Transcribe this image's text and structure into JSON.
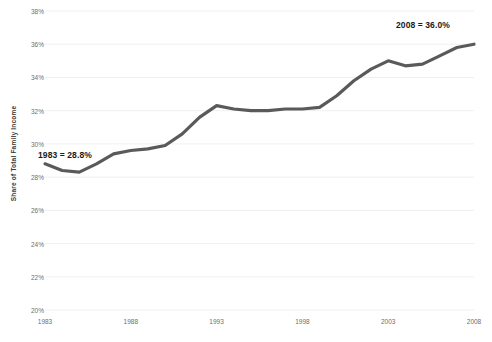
{
  "chart_data": {
    "type": "line",
    "title": "",
    "xlabel": "",
    "ylabel": "Share of Total Family Income",
    "xlim": [
      1983,
      2008
    ],
    "ylim": [
      20,
      38
    ],
    "ytick_labels": [
      "38%",
      "36%",
      "34%",
      "32%",
      "30%",
      "28%",
      "26%",
      "24%",
      "22%",
      "20%"
    ],
    "ytick_values": [
      38,
      36,
      34,
      32,
      30,
      28,
      26,
      24,
      22,
      20
    ],
    "xtick_labels": [
      "1983",
      "1988",
      "1993",
      "1998",
      "2003",
      "2008"
    ],
    "xtick_values": [
      1983,
      1988,
      1993,
      1998,
      2003,
      2008
    ],
    "grid": true,
    "legend": "none",
    "series": [
      {
        "name": "Share of Total Family Income",
        "color": "#5a5a5a",
        "x": [
          1983,
          1984,
          1985,
          1986,
          1987,
          1988,
          1989,
          1990,
          1991,
          1992,
          1993,
          1994,
          1995,
          1996,
          1997,
          1998,
          1999,
          2000,
          2001,
          2002,
          2003,
          2004,
          2005,
          2006,
          2007,
          2008
        ],
        "values": [
          28.8,
          28.4,
          28.3,
          28.8,
          29.4,
          29.6,
          29.7,
          29.9,
          30.6,
          31.6,
          32.3,
          32.1,
          32.0,
          32.0,
          32.1,
          32.1,
          32.2,
          32.9,
          33.8,
          34.5,
          35.0,
          34.7,
          34.8,
          35.3,
          35.8,
          36.0
        ]
      }
    ],
    "annotations": [
      {
        "id": "start",
        "text": "1983 = 28.8%",
        "x": 1983,
        "y": 28.8
      },
      {
        "id": "end",
        "text": "2008 = 36.0%",
        "x": 2008,
        "y": 36.0
      }
    ]
  },
  "axis": {
    "y_title": "Share of Total Family Income"
  },
  "annotations": {
    "start_label": "1983 = 28.8%",
    "end_label": "2008 = 36.0%"
  },
  "colors": {
    "line": "#5a5a5a",
    "grid": "#f0f0f0",
    "tick_text": "#6e6e6e",
    "annotation_text": "#1a1a1a",
    "background": "#ffffff"
  }
}
